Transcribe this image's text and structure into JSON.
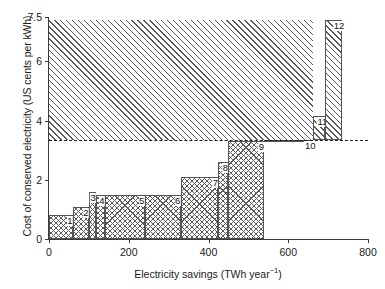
{
  "chart_data": {
    "type": "bar",
    "title": "",
    "xlabel": "Electricity savings (TWh year−1)",
    "ylabel": "Cost of conserved electricity (US cents per kWh)",
    "xlabel_base": "Electricity savings (TWh year",
    "xlabel_sup": "−1",
    "xlabel_tail": ")",
    "xlim": [
      0,
      800
    ],
    "ylim": [
      0,
      7.5
    ],
    "grid": false,
    "legend": "none",
    "orientation": "supply-curve / step histogram",
    "xticks": [
      0,
      200,
      400,
      600,
      800
    ],
    "xtick_labels": [
      "0",
      "200",
      "400",
      "600",
      "800"
    ],
    "yticks": [
      0,
      2,
      4,
      6,
      7.5
    ],
    "ytick_labels": [
      "0",
      "2",
      "4",
      "6",
      "7.5"
    ],
    "reference_line": {
      "type": "horizontal-dashed",
      "value": 3.33,
      "label": ""
    },
    "bars": [
      {
        "label": "1",
        "x_start": 0,
        "x_end": 60,
        "width": 60,
        "cost": 0.8,
        "fill": "cross"
      },
      {
        "label": "2",
        "x_start": 60,
        "x_end": 100,
        "width": 40,
        "cost": 1.07,
        "fill": "cross"
      },
      {
        "label": "3",
        "x_start": 100,
        "x_end": 118,
        "width": 18,
        "cost": 1.58,
        "fill": "cross"
      },
      {
        "label": "4",
        "x_start": 118,
        "x_end": 140,
        "width": 22,
        "cost": 1.5,
        "fill": "cross"
      },
      {
        "label": "5",
        "x_start": 140,
        "x_end": 240,
        "width": 100,
        "cost": 1.5,
        "fill": "cross"
      },
      {
        "label": "6",
        "x_start": 240,
        "x_end": 330,
        "width": 90,
        "cost": 1.5,
        "fill": "cross"
      },
      {
        "label": "7",
        "x_start": 330,
        "x_end": 425,
        "width": 95,
        "cost": 2.08,
        "fill": "cross"
      },
      {
        "label": "8",
        "x_start": 425,
        "x_end": 450,
        "width": 25,
        "cost": 2.59,
        "fill": "cross"
      },
      {
        "label": "9",
        "x_start": 450,
        "x_end": 540,
        "width": 90,
        "cost": 3.3,
        "fill": "cross"
      },
      {
        "label": "10",
        "x_start": 540,
        "x_end": 663,
        "width": 123,
        "cost": 3.33,
        "fill": "hatch"
      },
      {
        "label": "11",
        "x_start": 663,
        "x_end": 693,
        "width": 30,
        "cost": 4.17,
        "fill": "hatch"
      },
      {
        "label": "12",
        "x_start": 693,
        "x_end": 735,
        "width": 42,
        "cost": 7.4,
        "fill": "hatch"
      }
    ],
    "upper_region": {
      "description": "diagonally hatched area above the dashed reference line",
      "fill": "hatch"
    }
  }
}
